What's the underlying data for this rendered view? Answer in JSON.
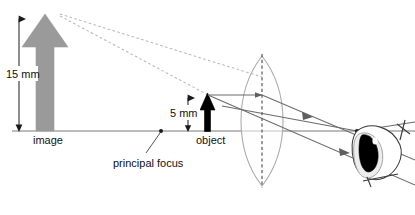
{
  "diagram": {
    "type": "optics-ray-diagram",
    "labels": {
      "image_height": "15 mm",
      "object_height": "5 mm",
      "image": "image",
      "object": "object",
      "principal_focus": "principal focus"
    },
    "colors": {
      "image_arrow_fill": "#9a9a9a",
      "image_arrow_stroke": "#9a9a9a",
      "object_arrow": "#000000",
      "axis": "#7a7a7a",
      "ray": "#6b6b6b",
      "virtual_ray_dashed": "#b9b9b9",
      "lens_outline": "#a7a7a7",
      "lens_axis_dashed": "#555555",
      "eye_outline": "#3a3a3a",
      "pupil": "#000000",
      "dimension_line": "#222222",
      "text": "#111111"
    },
    "geometry": {
      "principal_axis_y": 131,
      "lens_center_x": 262,
      "lens_top_y": 56,
      "lens_bottom_y": 186,
      "principal_focus_x": 161,
      "object_x": 207,
      "object_tip_y": 95,
      "image_x": 45,
      "image_tip_y": 16,
      "convergence_x": 357
    },
    "parts": [
      "image-arrow",
      "object-arrow",
      "lens",
      "principal-axis",
      "principal-focus-point",
      "eye",
      "ray-lines",
      "virtual-ray-lines",
      "dimension-15mm",
      "dimension-5mm"
    ]
  }
}
